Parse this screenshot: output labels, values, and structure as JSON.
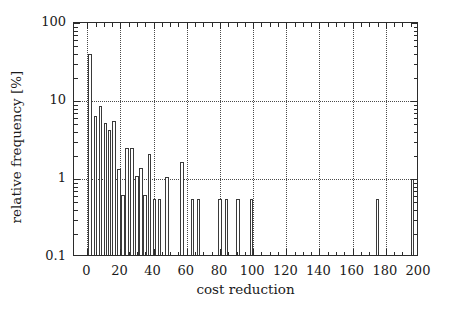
{
  "chart_data": {
    "type": "bar",
    "title": "",
    "subtitle": "",
    "xlabel": "cost reduction",
    "ylabel": "relative frequency [%]",
    "yscale": "log",
    "xscale": "linear",
    "xlim": [
      -8,
      200
    ],
    "ylim": [
      0.1,
      100
    ],
    "grid": "dotted gridlines at x major ticks and y decades",
    "legend": null,
    "xticks": [
      0,
      20,
      40,
      60,
      80,
      100,
      120,
      140,
      160,
      180,
      200
    ],
    "xticklabels": [
      "0",
      "20",
      "40",
      "60",
      "80",
      "100",
      "120",
      "140",
      "160",
      "180",
      "200"
    ],
    "yticks": [
      0.1,
      1,
      10,
      100
    ],
    "yticklabels": [
      "0.1",
      "1",
      "10",
      "100"
    ],
    "bar_width": 2.2,
    "note": "Histogram of cost reduction values; bars are hollow/white with thin dark outlines on a log-scale y axis.",
    "bars": [
      {
        "x": 1.5,
        "value": 40.0
      },
      {
        "x": 5.0,
        "value": 6.5
      },
      {
        "x": 8.0,
        "value": 8.6
      },
      {
        "x": 11.0,
        "value": 5.2
      },
      {
        "x": 13.5,
        "value": 4.2
      },
      {
        "x": 16.0,
        "value": 5.5
      },
      {
        "x": 19.0,
        "value": 1.35
      },
      {
        "x": 21.5,
        "value": 0.62
      },
      {
        "x": 24.0,
        "value": 2.5
      },
      {
        "x": 27.0,
        "value": 2.5
      },
      {
        "x": 30.0,
        "value": 1.1
      },
      {
        "x": 32.5,
        "value": 1.4
      },
      {
        "x": 35.0,
        "value": 0.62
      },
      {
        "x": 37.5,
        "value": 2.1
      },
      {
        "x": 40.5,
        "value": 0.55
      },
      {
        "x": 43.5,
        "value": 0.55
      },
      {
        "x": 48.0,
        "value": 1.05
      },
      {
        "x": 57.0,
        "value": 1.65
      },
      {
        "x": 63.5,
        "value": 0.55
      },
      {
        "x": 67.0,
        "value": 0.55
      },
      {
        "x": 80.0,
        "value": 0.55
      },
      {
        "x": 84.0,
        "value": 0.55
      },
      {
        "x": 91.0,
        "value": 0.55
      },
      {
        "x": 99.0,
        "value": 0.55
      },
      {
        "x": 175.0,
        "value": 0.55
      },
      {
        "x": 196.0,
        "value": 1.0
      }
    ]
  },
  "axes": {
    "xminor_step": 5,
    "yminor_decade_steps": [
      2,
      3,
      4,
      5,
      6,
      7,
      8,
      9
    ]
  }
}
